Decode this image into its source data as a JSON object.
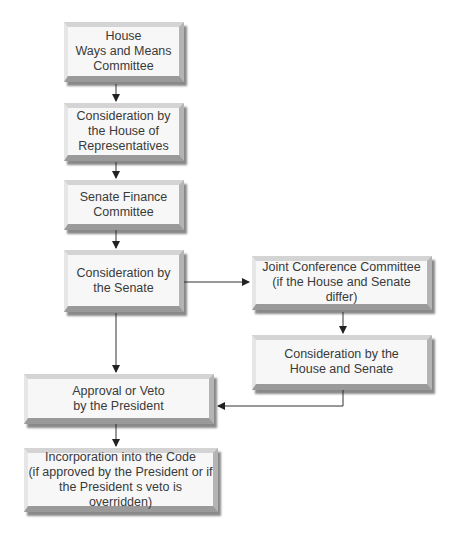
{
  "diagram": {
    "type": "flowchart",
    "nodes": [
      {
        "id": "house-ways-means",
        "label": "House\nWays and Means\nCommittee"
      },
      {
        "id": "house-consideration",
        "label": "Consideration by\nthe House of\nRepresentatives"
      },
      {
        "id": "senate-finance",
        "label": "Senate Finance\nCommittee"
      },
      {
        "id": "senate-consideration",
        "label": "Consideration by\nthe Senate"
      },
      {
        "id": "joint-conference",
        "label": "Joint Conference Committee\n(if the House and Senate differ)"
      },
      {
        "id": "house-senate-consideration",
        "label": "Consideration by the\nHouse and Senate"
      },
      {
        "id": "president",
        "label": "Approval or Veto\nby the President"
      },
      {
        "id": "incorporation",
        "label": "Incorporation into the Code\n(if approved by the President or if\nthe President s veto is overridden)"
      }
    ],
    "edges": [
      {
        "from": "house-ways-means",
        "to": "house-consideration"
      },
      {
        "from": "house-consideration",
        "to": "senate-finance"
      },
      {
        "from": "senate-finance",
        "to": "senate-consideration"
      },
      {
        "from": "senate-consideration",
        "to": "joint-conference"
      },
      {
        "from": "senate-consideration",
        "to": "president"
      },
      {
        "from": "joint-conference",
        "to": "house-senate-consideration"
      },
      {
        "from": "house-senate-consideration",
        "to": "president"
      },
      {
        "from": "president",
        "to": "incorporation"
      }
    ]
  }
}
